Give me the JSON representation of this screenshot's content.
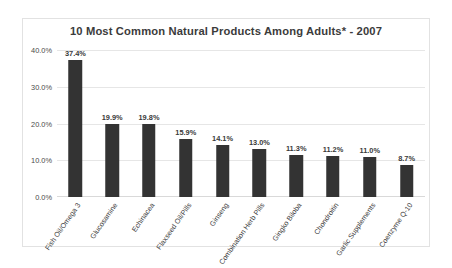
{
  "chart_data": {
    "type": "bar",
    "title": "10 Most Common Natural Products Among Adults* - 2007",
    "xlabel": "",
    "ylabel": "",
    "ylim": [
      0,
      40
    ],
    "grid": true,
    "legend": "none",
    "yticks": [
      "0.0%",
      "10.0%",
      "20.0%",
      "30.0%",
      "40.0%"
    ],
    "ytick_values": [
      0,
      10,
      20,
      30,
      40
    ],
    "categories": [
      "Fish Oil/Omega 3",
      "Glucosamine",
      "Echinacea",
      "Flaxseed Oil/Pills",
      "Ginseng",
      "Combination Herb Pills",
      "Gingko Biloba",
      "Chondroitin",
      "Garlic Supplements",
      "Coenzyme Q-10"
    ],
    "values": [
      37.4,
      19.9,
      19.8,
      15.9,
      14.1,
      13.0,
      11.3,
      11.2,
      11.0,
      8.7
    ],
    "data_labels": [
      "37.4%",
      "19.9%",
      "19.8%",
      "15.9%",
      "14.1%",
      "13.0%",
      "11.3%",
      "11.2%",
      "11.0%",
      "8.7%"
    ],
    "bar_color": "#333333",
    "grid_color": "#e6e6e6",
    "frame_color": "#e2e2e2"
  }
}
